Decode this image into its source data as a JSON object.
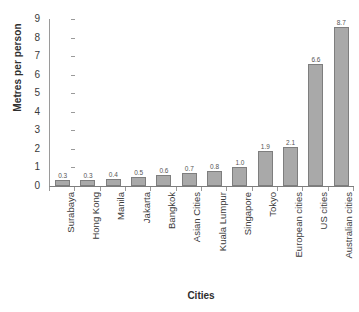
{
  "chart_data": {
    "type": "bar",
    "title": "",
    "xlabel": "Cities",
    "ylabel": "Metres per person",
    "ylim": [
      0,
      9
    ],
    "yticks": [
      "0",
      "1",
      "2",
      "3",
      "4",
      "5",
      "6",
      "7",
      "8",
      "9"
    ],
    "grid": false,
    "legend": "none",
    "orientation": "vertical",
    "bar_color": "#a9a9a9",
    "bar_border_color": "#7e7e7e",
    "axis_color": "#9a9a9a",
    "categories": [
      "Surabaya",
      "Hong Kong",
      "Manila",
      "Jakarta",
      "Bangkok",
      "Asian Cities",
      "Kuala Lumpur",
      "Singapore",
      "Tokyo",
      "European cities",
      "US cities",
      "Australian cities"
    ],
    "values": [
      0.3,
      0.3,
      0.4,
      0.5,
      0.6,
      0.7,
      0.8,
      1.0,
      1.9,
      2.1,
      6.6,
      8.7
    ],
    "value_labels": [
      "0.3",
      "0.3",
      "0.4",
      "0.5",
      "0.6",
      "0.7",
      "0.8",
      "1.0",
      "1.9",
      "2.1",
      "6.6",
      "8.7"
    ]
  }
}
